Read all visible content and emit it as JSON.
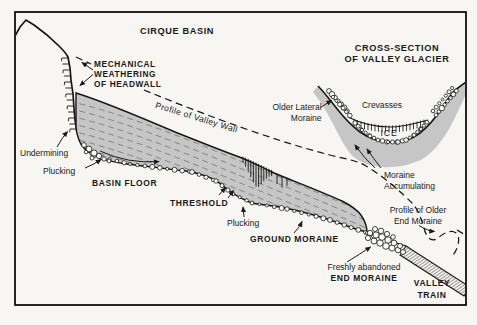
{
  "colors": {
    "background": "#f7f6f2",
    "ink": "#1a1a1a",
    "glacier_gray": "#c6c6c6",
    "flow_line": "#7a7a7a",
    "boulder_fill": "#fdfdfa"
  },
  "titles": {
    "cirque": "CIRQUE BASIN",
    "cross_section": [
      "CROSS-SECTION",
      "OF VALLEY GLACIER"
    ]
  },
  "labels": {
    "mechanical": [
      "MECHANICAL",
      "WEATHERING",
      "OF HEADWALL"
    ],
    "profile_valley_wall": "Profile of Valley Wall",
    "older_lateral": [
      "Older Lateral",
      "Moraine"
    ],
    "crevasses": "Crevasses",
    "ice": "ICE",
    "moraine_accumulating": [
      "Moraine",
      "Accumulating"
    ],
    "undermining": "Undermining",
    "plucking_left": "Plucking",
    "basin_floor": "BASIN FLOOR",
    "threshold": "THRESHOLD",
    "plucking_right": "Plucking",
    "ground_moraine": "GROUND MORAINE",
    "profile_older_end_moraine": [
      "Profile of Older",
      "End Moraine"
    ],
    "freshly_abandoned": [
      "Freshly abandoned",
      "END MORAINE"
    ],
    "valley_train": [
      "VALLEY",
      "TRAIN"
    ]
  }
}
